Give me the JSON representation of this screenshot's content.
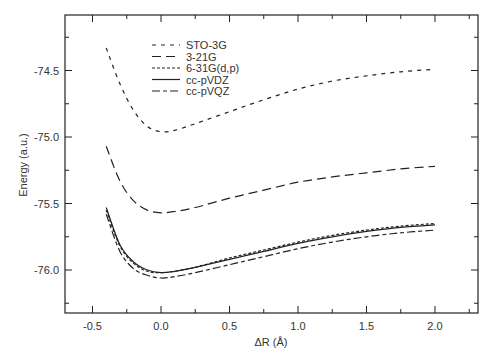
{
  "chart_data": {
    "type": "line",
    "title": "",
    "xlabel": "ΔR (Å)",
    "ylabel": "Energy (a.u.)",
    "xlim": [
      -0.7,
      2.3
    ],
    "ylim": [
      -76.3,
      -74.05
    ],
    "xticks": [
      -0.5,
      0.0,
      0.5,
      1.0,
      1.5,
      2.0
    ],
    "xtick_labels": [
      "-0.5",
      "0.0",
      "0.5",
      "1.0",
      "1.5",
      "2.0"
    ],
    "xticks_minor": [
      -0.25,
      0.25,
      0.75,
      1.25,
      1.75,
      2.25
    ],
    "yticks": [
      -74.5,
      -75.0,
      -75.5,
      -76.0
    ],
    "ytick_labels": [
      "-74.5",
      "-75.0",
      "-75.5",
      "-76.0"
    ],
    "yticks_minor": [
      -74.25,
      -74.75,
      -75.25,
      -75.75,
      -76.25
    ],
    "grid": false,
    "legend_position": "upper left (inside)",
    "x": [
      -0.4,
      -0.3,
      -0.2,
      -0.1,
      0.0,
      0.1,
      0.25,
      0.5,
      0.75,
      1.0,
      1.25,
      1.5,
      1.75,
      2.0
    ],
    "series": [
      {
        "name": "STO-3G",
        "dash": "4,5",
        "values": [
          -74.33,
          -74.6,
          -74.8,
          -74.92,
          -74.96,
          -74.95,
          -74.9,
          -74.81,
          -74.72,
          -74.64,
          -74.58,
          -74.54,
          -74.51,
          -74.49
        ]
      },
      {
        "name": "3-21G",
        "dash": "9,5",
        "values": [
          -75.07,
          -75.33,
          -75.48,
          -75.55,
          -75.57,
          -75.56,
          -75.53,
          -75.46,
          -75.4,
          -75.34,
          -75.3,
          -75.27,
          -75.24,
          -75.22
        ]
      },
      {
        "name": "6-31G(d,p)",
        "dash": "3,2",
        "values": [
          -75.55,
          -75.82,
          -75.95,
          -76.01,
          -76.02,
          -76.01,
          -75.98,
          -75.91,
          -75.85,
          -75.79,
          -75.74,
          -75.7,
          -75.67,
          -75.65
        ]
      },
      {
        "name": "cc-pVDZ",
        "dash": "",
        "values": [
          -75.53,
          -75.81,
          -75.94,
          -76.0,
          -76.02,
          -76.01,
          -75.98,
          -75.92,
          -75.86,
          -75.8,
          -75.75,
          -75.71,
          -75.68,
          -75.66
        ]
      },
      {
        "name": "cc-pVQZ",
        "dash": "8,3,4,3",
        "values": [
          -75.58,
          -75.86,
          -75.99,
          -76.04,
          -76.06,
          -76.05,
          -76.02,
          -75.96,
          -75.9,
          -75.84,
          -75.79,
          -75.75,
          -75.72,
          -75.7
        ]
      }
    ]
  }
}
